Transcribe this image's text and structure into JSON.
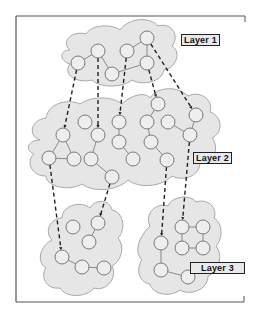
{
  "colors": {
    "cloud_fill": "#e6e6e6",
    "cloud_stroke": "#a8a8a8",
    "node_fill": "#eeeeee",
    "node_stroke": "#7a7a7a",
    "edge": "#8a8a8a",
    "dashed_link": "#222222",
    "frame": "#555555"
  },
  "labels": {
    "layer1": "Layer 1",
    "layer2": "Layer 2",
    "layer3": "Layer 3"
  },
  "chart_data": {
    "type": "diagram",
    "title": "",
    "layers": [
      {
        "name": "Layer 1",
        "nodes": [
          {
            "id": "a",
            "x": 78,
            "y": 63
          },
          {
            "id": "b",
            "x": 98,
            "y": 51
          },
          {
            "id": "c",
            "x": 112,
            "y": 74
          },
          {
            "id": "d",
            "x": 127,
            "y": 51
          },
          {
            "id": "e",
            "x": 147,
            "y": 38
          },
          {
            "id": "f",
            "x": 147,
            "y": 63
          }
        ],
        "edges": [
          [
            "a",
            "b"
          ],
          [
            "b",
            "c"
          ],
          [
            "c",
            "f"
          ],
          [
            "d",
            "e"
          ],
          [
            "e",
            "f"
          ]
        ]
      },
      {
        "name": "Layer 2",
        "nodes": [
          {
            "id": "A",
            "x": 63,
            "y": 135
          },
          {
            "id": "B",
            "x": 85,
            "y": 122
          },
          {
            "id": "C",
            "x": 98,
            "y": 135
          },
          {
            "id": "D",
            "x": 119,
            "y": 122
          },
          {
            "id": "E",
            "x": 49,
            "y": 158
          },
          {
            "id": "F",
            "x": 74,
            "y": 159
          },
          {
            "id": "G",
            "x": 91,
            "y": 159
          },
          {
            "id": "H",
            "x": 119,
            "y": 142
          },
          {
            "id": "I",
            "x": 133,
            "y": 159
          },
          {
            "id": "J",
            "x": 112,
            "y": 177
          },
          {
            "id": "K",
            "x": 158,
            "y": 104
          },
          {
            "id": "L",
            "x": 147,
            "y": 122
          },
          {
            "id": "M",
            "x": 168,
            "y": 122
          },
          {
            "id": "N",
            "x": 196,
            "y": 115
          },
          {
            "id": "O",
            "x": 151,
            "y": 142
          },
          {
            "id": "P",
            "x": 190,
            "y": 135
          },
          {
            "id": "Q",
            "x": 167,
            "y": 160
          }
        ],
        "edges": [
          [
            "A",
            "E"
          ],
          [
            "A",
            "F"
          ],
          [
            "E",
            "F"
          ],
          [
            "C",
            "G"
          ],
          [
            "G",
            "J"
          ],
          [
            "D",
            "H"
          ],
          [
            "H",
            "I"
          ],
          [
            "K",
            "L"
          ],
          [
            "L",
            "O"
          ],
          [
            "O",
            "Q"
          ],
          [
            "M",
            "P"
          ],
          [
            "N",
            "P"
          ]
        ]
      },
      {
        "name": "Layer 3",
        "nodes": [
          {
            "id": "r1",
            "x": 73,
            "y": 227
          },
          {
            "id": "r2",
            "x": 98,
            "y": 223
          },
          {
            "id": "r3",
            "x": 89,
            "y": 242
          },
          {
            "id": "r4",
            "x": 62,
            "y": 257
          },
          {
            "id": "r5",
            "x": 82,
            "y": 267
          },
          {
            "id": "r6",
            "x": 104,
            "y": 268
          },
          {
            "id": "s1",
            "x": 161,
            "y": 243
          },
          {
            "id": "s2",
            "x": 182,
            "y": 227
          },
          {
            "id": "s3",
            "x": 203,
            "y": 227
          },
          {
            "id": "s4",
            "x": 182,
            "y": 248
          },
          {
            "id": "s5",
            "x": 203,
            "y": 248
          },
          {
            "id": "s6",
            "x": 161,
            "y": 270
          },
          {
            "id": "s7",
            "x": 188,
            "y": 277
          }
        ],
        "edges": [
          [
            "r2",
            "r3"
          ],
          [
            "r4",
            "r5"
          ],
          [
            "r5",
            "r6"
          ],
          [
            "s2",
            "s3"
          ],
          [
            "s2",
            "s4"
          ],
          [
            "s3",
            "s5"
          ],
          [
            "s4",
            "s5"
          ],
          [
            "s1",
            "s6"
          ],
          [
            "s6",
            "s7"
          ]
        ]
      }
    ],
    "inter_layer_links": [
      [
        "a",
        "A"
      ],
      [
        "b",
        "C"
      ],
      [
        "d",
        "D"
      ],
      [
        "f",
        "K"
      ],
      [
        "e",
        "N"
      ],
      [
        "E",
        "r4"
      ],
      [
        "J",
        "r2"
      ],
      [
        "Q",
        "s1"
      ],
      [
        "P",
        "s2"
      ]
    ]
  }
}
